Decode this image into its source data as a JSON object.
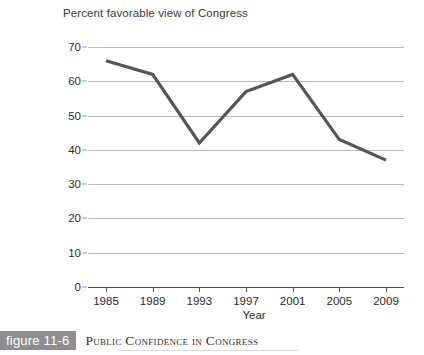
{
  "chart_data": {
    "type": "line",
    "title": "Percent favorable view of Congress",
    "xlabel": "Year",
    "ylabel": "",
    "categories": [
      "1985",
      "1989",
      "1993",
      "1997",
      "2001",
      "2005",
      "2009"
    ],
    "x": [
      1985,
      1989,
      1993,
      1997,
      2001,
      2005,
      2009
    ],
    "values": [
      66,
      62,
      42,
      57,
      62,
      43,
      37
    ],
    "series": [
      {
        "name": "Percent favorable view of Congress",
        "values": [
          66,
          62,
          42,
          57,
          62,
          43,
          37
        ]
      }
    ],
    "ylim": [
      0,
      70
    ],
    "yticks": [
      0,
      10,
      20,
      30,
      40,
      50,
      60,
      70
    ],
    "ytick_labels": [
      "0",
      "10",
      "20",
      "30",
      "40",
      "50",
      "60",
      "70"
    ],
    "xlim": [
      1985,
      2009
    ],
    "grid": "horizontal",
    "legend": "none",
    "line_color": "#555555",
    "grid_color": "#b9b9b9",
    "axis_color": "#4a4a4a"
  },
  "caption": {
    "badge_label": "figure 11-6",
    "title": "Public Confidence in Congress",
    "badge_color": "#8e8e8e"
  }
}
